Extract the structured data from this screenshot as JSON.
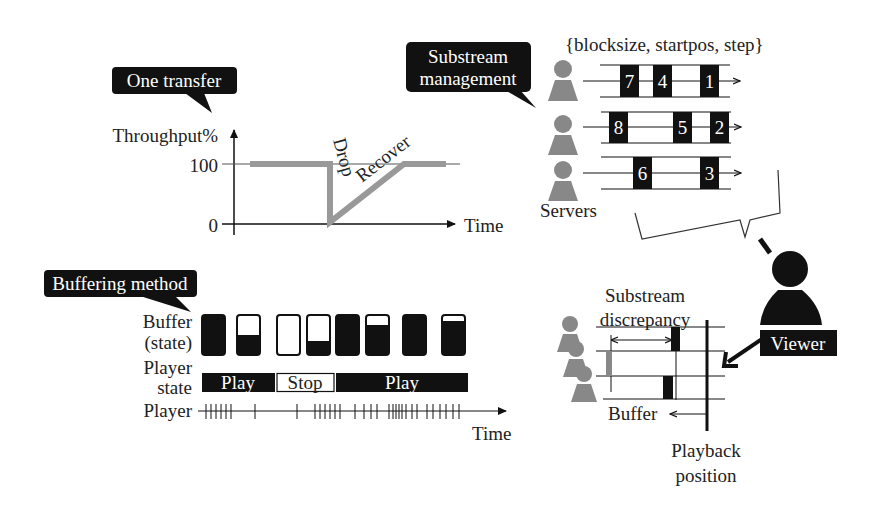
{
  "colors": {
    "ink": "#111111",
    "gray_line": "#999999",
    "server_gray": "#8a8a8a",
    "bubble_bg": "#111111",
    "bubble_text": "#ffffff"
  },
  "one_transfer": {
    "bubble_label": "One transfer",
    "y_axis_label": "Throughput%",
    "tick_100": "100",
    "tick_0": "0",
    "x_axis_label": "Time",
    "drop_label": "Drop",
    "recover_label": "Recover"
  },
  "substream": {
    "bubble_line1": "Substream",
    "bubble_line2": "management",
    "params_label": "{blocksize, startpos, step}",
    "servers_label": "Servers",
    "rows": [
      {
        "blocks": [
          "7",
          "4",
          "1"
        ]
      },
      {
        "blocks": [
          "8",
          "5",
          "2"
        ]
      },
      {
        "blocks": [
          "6",
          "3"
        ]
      }
    ]
  },
  "buffering": {
    "bubble_label": "Buffering method",
    "buffer_label_line1": "Buffer",
    "buffer_label_line2": "(state)",
    "player_state_line1": "Player",
    "player_state_line2": "state",
    "player_label": "Player",
    "time_label": "Time",
    "states": [
      {
        "label": "Play"
      },
      {
        "label": "Stop"
      },
      {
        "label": "Play"
      }
    ],
    "buffer_fill_levels": [
      1.0,
      0.5,
      0.0,
      0.35,
      1.0,
      0.75,
      1.0,
      0.85
    ]
  },
  "viewer": {
    "label": "Viewer",
    "discrepancy_line1": "Substream",
    "discrepancy_line2": "discrepancy",
    "buffer_label": "Buffer",
    "playback_line1": "Playback",
    "playback_line2": "position"
  },
  "chart_data": {
    "type": "line",
    "title": "One transfer",
    "xlabel": "Time",
    "ylabel": "Throughput%",
    "y_ticks": [
      0,
      100
    ],
    "ylim": [
      0,
      100
    ],
    "x": [
      0,
      1,
      2,
      3,
      4,
      5,
      6
    ],
    "series": [
      {
        "name": "Throughput",
        "values": [
          100,
          100,
          100,
          0,
          50,
          100,
          100
        ]
      }
    ],
    "annotations": [
      "Drop",
      "Recover"
    ]
  }
}
